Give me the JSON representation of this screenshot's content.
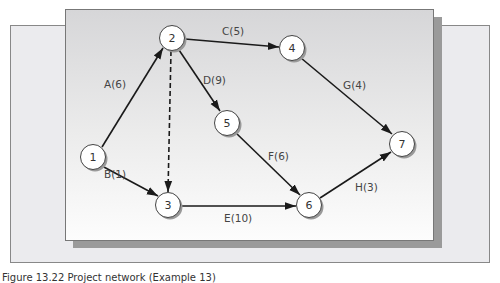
{
  "diagram": {
    "type": "activity-on-arrow network",
    "nodes": [
      {
        "id": "1",
        "x": 93,
        "y": 157
      },
      {
        "id": "2",
        "x": 172,
        "y": 38
      },
      {
        "id": "3",
        "x": 168,
        "y": 205
      },
      {
        "id": "4",
        "x": 292,
        "y": 48
      },
      {
        "id": "5",
        "x": 227,
        "y": 123
      },
      {
        "id": "6",
        "x": 309,
        "y": 205
      },
      {
        "id": "7",
        "x": 402,
        "y": 144
      }
    ],
    "edges": [
      {
        "from": "1",
        "to": "2",
        "label": "A(6)",
        "activity": "A",
        "duration": 6,
        "dashed": false
      },
      {
        "from": "1",
        "to": "3",
        "label": "B(1)",
        "activity": "B",
        "duration": 1,
        "dashed": false
      },
      {
        "from": "2",
        "to": "4",
        "label": "C(5)",
        "activity": "C",
        "duration": 5,
        "dashed": false
      },
      {
        "from": "2",
        "to": "5",
        "label": "D(9)",
        "activity": "D",
        "duration": 9,
        "dashed": false
      },
      {
        "from": "2",
        "to": "3",
        "label": "",
        "activity": "dummy",
        "duration": 0,
        "dashed": true
      },
      {
        "from": "3",
        "to": "6",
        "label": "E(10)",
        "activity": "E",
        "duration": 10,
        "dashed": false
      },
      {
        "from": "5",
        "to": "6",
        "label": "F(6)",
        "activity": "F",
        "duration": 6,
        "dashed": false
      },
      {
        "from": "4",
        "to": "7",
        "label": "G(4)",
        "activity": "G",
        "duration": 4,
        "dashed": false
      },
      {
        "from": "6",
        "to": "7",
        "label": "H(3)",
        "activity": "H",
        "duration": 3,
        "dashed": false
      }
    ],
    "labels": {
      "A": "A(6)",
      "B": "B(1)",
      "C": "C(5)",
      "D": "D(9)",
      "E": "E(10)",
      "F": "F(6)",
      "G": "G(4)",
      "H": "H(3)"
    },
    "node_labels": {
      "n1": "1",
      "n2": "2",
      "n3": "3",
      "n4": "4",
      "n5": "5",
      "n6": "6",
      "n7": "7"
    }
  },
  "caption": "Figure 13.22  Project network (Example 13)"
}
